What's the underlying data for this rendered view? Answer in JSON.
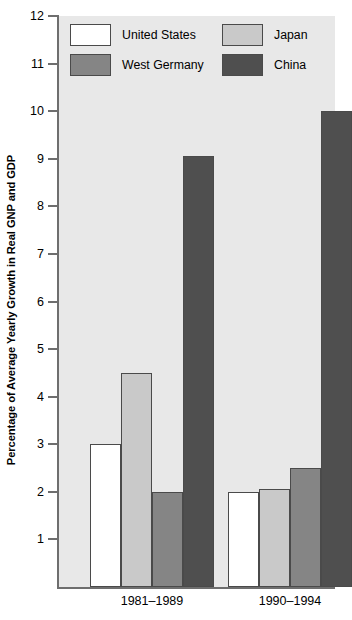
{
  "chart_data": {
    "type": "bar",
    "title": "",
    "xlabel": "",
    "ylabel": "Percentage of Average Yearly Growth in Real GNP and GDP",
    "categories": [
      "1981–1989",
      "1990–1994"
    ],
    "ylim": [
      0,
      12
    ],
    "ytick_labels": [
      "12",
      "11",
      "10",
      "9",
      "8",
      "7",
      "6",
      "5",
      "4",
      "3",
      "2",
      "1"
    ],
    "ytick_values": [
      12,
      11,
      10,
      9,
      8,
      7,
      6,
      5,
      4,
      3,
      2,
      1
    ],
    "grid": false,
    "legend_position": "top-inside",
    "series": [
      {
        "name": "United States",
        "color": "#ffffff",
        "values": [
          3.0,
          2.0
        ]
      },
      {
        "name": "Japan",
        "color": "#c9c9c9",
        "values": [
          4.5,
          2.05
        ]
      },
      {
        "name": "West Germany",
        "color": "#858585",
        "values": [
          2.0,
          2.5
        ]
      },
      {
        "name": "China",
        "color": "#4f4f4f",
        "values": [
          9.05,
          10.0
        ]
      }
    ],
    "legend_order": [
      "United States",
      "Japan",
      "West Germany",
      "China"
    ],
    "plot_background": "#e8e8e8",
    "axis_color": "#6e6e6e",
    "bar_edge_color": "#4a4a4a"
  }
}
